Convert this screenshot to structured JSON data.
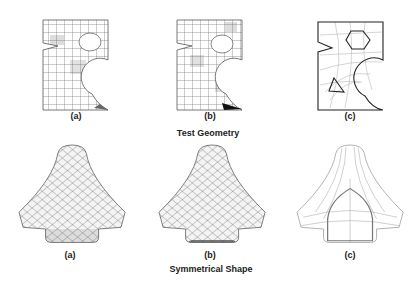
{
  "top_row": {
    "title": "Test Geometry",
    "panels": [
      {
        "label": "(a)",
        "description": "quad mesh of plate with cutouts, shaded elements"
      },
      {
        "label": "(b)",
        "description": "refined quad mesh with dark corner elements"
      },
      {
        "label": "(c)",
        "description": "geometry outline with hexagon and triangle holes and frame lines"
      }
    ]
  },
  "bottom_row": {
    "title": "Symmetrical Shape",
    "panels": [
      {
        "label": "(a)",
        "description": "quad mesh of symmetrical shape"
      },
      {
        "label": "(b)",
        "description": "alternative quad mesh of symmetrical shape"
      },
      {
        "label": "(c)",
        "description": "frame/skeleton lines of symmetrical shape"
      }
    ]
  },
  "colors": {
    "mesh_line": "#444444",
    "shade": "#d8d8d8",
    "frame": "#999999",
    "outline": "#222222"
  }
}
